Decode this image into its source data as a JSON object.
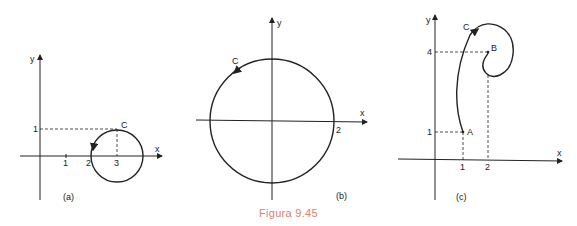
{
  "caption": "Figura 9.45",
  "panels": [
    {
      "id": "a",
      "label": "(a)",
      "axes": {
        "x": "x",
        "y": "y"
      },
      "ticks_x": [
        "1",
        "2",
        "3"
      ],
      "ticks_y": [
        "1"
      ],
      "curve_label": "C",
      "description": "Circle centered at (3,0) with radius 1, oriented clockwise"
    },
    {
      "id": "b",
      "label": "(b)",
      "axes": {
        "x": "x",
        "y": "y"
      },
      "ticks_x": [
        "2"
      ],
      "curve_label": "C",
      "description": "Circle centered at origin with radius 2, oriented counterclockwise"
    },
    {
      "id": "c",
      "label": "(c)",
      "axes": {
        "x": "x",
        "y": "y"
      },
      "ticks_x": [
        "1",
        "2"
      ],
      "ticks_y": [
        "1",
        "4"
      ],
      "points": [
        "A",
        "B"
      ],
      "curve_label": "C",
      "description": "Spiral curve from A(1,1) to B(2,4)"
    }
  ]
}
